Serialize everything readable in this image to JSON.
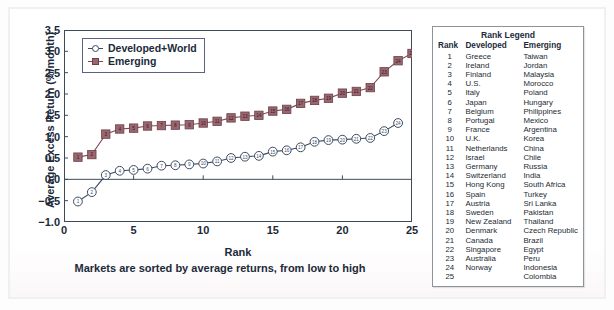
{
  "chart_data": {
    "type": "line",
    "title": "",
    "xlabel": "Rank",
    "xsubtitle": "Markets are sorted by average returns, from low to high",
    "ylabel": "Average Excess Return (%/month)",
    "xlim": [
      0,
      25
    ],
    "ylim": [
      -1.0,
      3.5
    ],
    "xticks": [
      0,
      5,
      10,
      15,
      20,
      25
    ],
    "yticks": [
      -1.0,
      -0.5,
      0.0,
      0.5,
      1.0,
      1.5,
      2.0,
      2.5,
      3.0,
      3.5
    ],
    "ytick_labels": [
      "-1.0",
      "-0.5",
      "0.0",
      "0.5",
      "1.0",
      "1.5",
      "2.0",
      "2.5",
      "3.0",
      "3.5"
    ],
    "grid": false,
    "legend_position": "upper-left-inside",
    "series": [
      {
        "name": "Developed+World",
        "marker": "circle-numbered",
        "color": "#3a4a63",
        "x": [
          1,
          2,
          3,
          4,
          5,
          6,
          7,
          8,
          9,
          10,
          11,
          12,
          13,
          14,
          15,
          16,
          17,
          18,
          19,
          20,
          21,
          22,
          23,
          24
        ],
        "values": [
          -0.52,
          -0.3,
          0.1,
          0.2,
          0.22,
          0.25,
          0.32,
          0.33,
          0.35,
          0.37,
          0.42,
          0.5,
          0.53,
          0.55,
          0.65,
          0.68,
          0.75,
          0.88,
          0.92,
          0.93,
          0.95,
          0.97,
          1.13,
          1.32
        ]
      },
      {
        "name": "Emerging",
        "marker": "square-numbered",
        "color": "#7d4b55",
        "x": [
          1,
          2,
          3,
          4,
          5,
          6,
          7,
          8,
          9,
          10,
          11,
          12,
          13,
          14,
          15,
          16,
          17,
          18,
          19,
          20,
          21,
          22,
          23,
          24,
          25
        ],
        "values": [
          0.52,
          0.58,
          1.06,
          1.18,
          1.2,
          1.25,
          1.26,
          1.27,
          1.28,
          1.32,
          1.36,
          1.44,
          1.48,
          1.5,
          1.6,
          1.64,
          1.78,
          1.85,
          1.9,
          2.02,
          2.06,
          2.15,
          2.52,
          2.78,
          2.95
        ]
      }
    ]
  },
  "plot_legend": {
    "items": [
      {
        "label": "Developed+World",
        "marker": "circle"
      },
      {
        "label": "Emerging",
        "marker": "square"
      }
    ]
  },
  "rank_legend": {
    "title": "Rank Legend",
    "columns": [
      "Rank",
      "Developed",
      "Emerging"
    ],
    "rows": [
      {
        "rank": "1",
        "developed": "Greece",
        "emerging": "Taiwan"
      },
      {
        "rank": "2",
        "developed": "Ireland",
        "emerging": "Jordan"
      },
      {
        "rank": "3",
        "developed": "Finland",
        "emerging": "Malaysia"
      },
      {
        "rank": "4",
        "developed": "U.S.",
        "emerging": "Morocco"
      },
      {
        "rank": "5",
        "developed": "Italy",
        "emerging": "Poland"
      },
      {
        "rank": "6",
        "developed": "Japan",
        "emerging": "Hungary"
      },
      {
        "rank": "7",
        "developed": "Belgium",
        "emerging": "Philippines"
      },
      {
        "rank": "8",
        "developed": "Portugal",
        "emerging": "Mexico"
      },
      {
        "rank": "9",
        "developed": "France",
        "emerging": "Argentina"
      },
      {
        "rank": "10",
        "developed": "U.K.",
        "emerging": "Korea"
      },
      {
        "rank": "11",
        "developed": "Netherlands",
        "emerging": "China"
      },
      {
        "rank": "12",
        "developed": "Israel",
        "emerging": "Chile"
      },
      {
        "rank": "13",
        "developed": "Germany",
        "emerging": "Russia"
      },
      {
        "rank": "14",
        "developed": "Switzerland",
        "emerging": "India"
      },
      {
        "rank": "15",
        "developed": "Hong Kong",
        "emerging": "South Africa"
      },
      {
        "rank": "16",
        "developed": "Spain",
        "emerging": "Turkey"
      },
      {
        "rank": "17",
        "developed": "Austria",
        "emerging": "Sri Lanka"
      },
      {
        "rank": "18",
        "developed": "Sweden",
        "emerging": "Pakistan"
      },
      {
        "rank": "19",
        "developed": "New Zealand",
        "emerging": "Thailand"
      },
      {
        "rank": "20",
        "developed": "Denmark",
        "emerging": "Czech Republic"
      },
      {
        "rank": "21",
        "developed": "Canada",
        "emerging": "Brazil"
      },
      {
        "rank": "22",
        "developed": "Singapore",
        "emerging": "Egypt"
      },
      {
        "rank": "23",
        "developed": "Australia",
        "emerging": "Peru"
      },
      {
        "rank": "24",
        "developed": "Norway",
        "emerging": "Indonesia"
      },
      {
        "rank": "25",
        "developed": "",
        "emerging": "Colombia"
      }
    ]
  },
  "colors": {
    "developed": "#3a4a63",
    "emerging": "#7d4b55",
    "axis": "#3f4a57",
    "text": "#1b2a3a"
  }
}
